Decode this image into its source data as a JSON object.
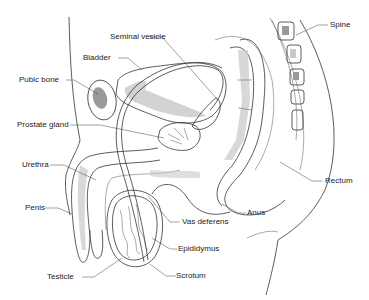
{
  "diagram": {
    "labels": [
      {
        "id": "seminal-vesicle",
        "text": "Seminal vesicle"
      },
      {
        "id": "bladder",
        "text": "Bladder"
      },
      {
        "id": "pubic-bone",
        "text": "Pubic bone"
      },
      {
        "id": "prostate-gland",
        "text": "Prostate gland"
      },
      {
        "id": "urethra",
        "text": "Urethra"
      },
      {
        "id": "penis",
        "text": "Penis"
      },
      {
        "id": "testicle",
        "text": "Testicle"
      },
      {
        "id": "scrotum",
        "text": "Scrotum"
      },
      {
        "id": "epididymus",
        "text": "Epididymus"
      },
      {
        "id": "vas-deferens",
        "text": "Vas deferens"
      },
      {
        "id": "anus",
        "text": "Anus"
      },
      {
        "id": "rectum",
        "text": "Rectum"
      },
      {
        "id": "spine",
        "text": "Spine"
      }
    ],
    "colors": {
      "line": "#333333",
      "shade": "#c8c8c8",
      "bone_shade": "#9a9a9a",
      "background": "#ffffff"
    }
  }
}
